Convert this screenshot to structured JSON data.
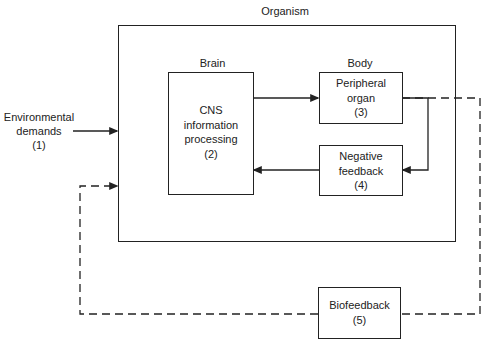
{
  "diagram": {
    "type": "block-diagram",
    "containers": {
      "organism": {
        "label": "Organism"
      },
      "brain": {
        "label": "Brain"
      },
      "body": {
        "label": "Body"
      }
    },
    "nodes": [
      {
        "id": "env",
        "label": "Environmental\ndemands\n(1)",
        "boxed": false
      },
      {
        "id": "cns",
        "label": "CNS\ninformation\nprocessing\n(2)",
        "boxed": true
      },
      {
        "id": "peripheral",
        "label": "Peripheral\norgan\n(3)",
        "boxed": true
      },
      {
        "id": "negfeedback",
        "label": "Negative\nfeedback\n(4)",
        "boxed": true
      },
      {
        "id": "biofeedback",
        "label": "Biofeedback\n(5)",
        "boxed": true
      }
    ],
    "edges": [
      {
        "from": "env",
        "to": "organism",
        "style": "solid"
      },
      {
        "from": "cns",
        "to": "peripheral",
        "style": "solid"
      },
      {
        "from": "peripheral",
        "to": "negfeedback",
        "style": "solid"
      },
      {
        "from": "negfeedback",
        "to": "cns",
        "style": "solid"
      },
      {
        "from": "peripheral",
        "to": "biofeedback",
        "style": "dashed"
      },
      {
        "from": "biofeedback",
        "to": "organism",
        "style": "dashed"
      }
    ]
  }
}
